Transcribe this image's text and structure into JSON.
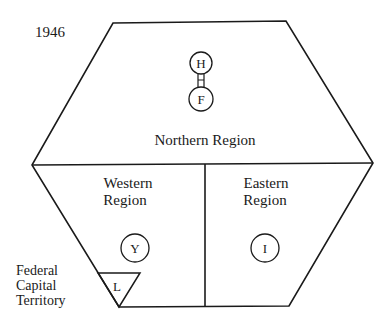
{
  "diagram": {
    "year": "1946",
    "regions": {
      "northern": {
        "label": "Northern Region"
      },
      "western": {
        "label_line1": "Western",
        "label_line2": "Region"
      },
      "eastern": {
        "label_line1": "Eastern",
        "label_line2": "Region"
      },
      "federal": {
        "label_line1": "Federal",
        "label_line2": "Capital",
        "label_line3": "Territory"
      }
    },
    "markers": {
      "h": "H",
      "f": "F",
      "y": "Y",
      "i": "I",
      "l": "L"
    },
    "colors": {
      "stroke": "#1a1a1a",
      "background": "#ffffff"
    }
  }
}
